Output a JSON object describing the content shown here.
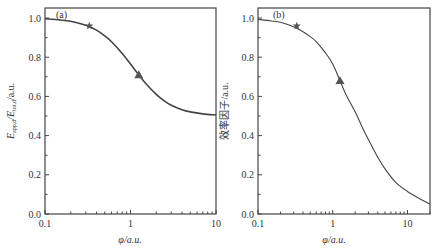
{
  "chart_data": [
    {
      "type": "line",
      "panel": "(a)",
      "title": "",
      "xlabel": "φ/a.u.",
      "ylabel": "E_app,d/E_tot,d/a.u.",
      "xscale": "log",
      "xlim": [
        0.1,
        10
      ],
      "ylim": [
        0.0,
        1.05
      ],
      "xticks": [
        "0.1",
        "1",
        "10"
      ],
      "yticks": [
        "0.0",
        "0.2",
        "0.4",
        "0.6",
        "0.8",
        "1.0"
      ],
      "grid": false,
      "series": [
        {
          "name": "curve",
          "x": [
            0.1,
            0.15,
            0.2,
            0.3,
            0.4,
            0.5,
            0.6,
            0.8,
            1.0,
            1.25,
            1.5,
            2.0,
            2.5,
            3.0,
            4.0,
            5.0,
            7.0,
            10.0
          ],
          "y": [
            0.996,
            0.99,
            0.983,
            0.963,
            0.938,
            0.909,
            0.879,
            0.819,
            0.765,
            0.71,
            0.667,
            0.61,
            0.576,
            0.555,
            0.532,
            0.521,
            0.511,
            0.505
          ]
        }
      ],
      "markers": [
        {
          "shape": "star",
          "x": 0.33,
          "y": 0.96
        },
        {
          "shape": "triangle",
          "x": 1.25,
          "y": 0.71
        }
      ]
    },
    {
      "type": "line",
      "panel": "(b)",
      "title": "",
      "xlabel": "φ/a.u.",
      "ylabel": "效率因子/a.u.",
      "xscale": "log",
      "xlim": [
        0.1,
        20
      ],
      "ylim": [
        0.0,
        1.05
      ],
      "xticks": [
        "0.1",
        "1",
        "10"
      ],
      "yticks": [
        "0.0",
        "0.2",
        "0.4",
        "0.6",
        "0.8",
        "1.0"
      ],
      "grid": false,
      "series": [
        {
          "name": "curve",
          "x": [
            0.1,
            0.15,
            0.2,
            0.3,
            0.4,
            0.5,
            0.6,
            0.8,
            1.0,
            1.25,
            1.5,
            2.0,
            2.5,
            3.0,
            4.0,
            5.0,
            7.0,
            10.0,
            15.0,
            20.0
          ],
          "y": [
            0.993,
            0.985,
            0.978,
            0.955,
            0.93,
            0.905,
            0.88,
            0.822,
            0.765,
            0.68,
            0.61,
            0.52,
            0.44,
            0.38,
            0.29,
            0.23,
            0.16,
            0.115,
            0.075,
            0.05
          ]
        }
      ],
      "markers": [
        {
          "shape": "star",
          "x": 0.33,
          "y": 0.96
        },
        {
          "shape": "triangle",
          "x": 1.25,
          "y": 0.68
        }
      ]
    }
  ],
  "panels": {
    "a": {
      "label": "(a)",
      "xlabel": "φ/a.u.",
      "ylabel_main": "E",
      "ylabel_sub1": "app,d",
      "ylabel_mid": "/E",
      "ylabel_sub2": "tot,d",
      "ylabel_tail": "/a.u."
    },
    "b": {
      "label": "(b)",
      "xlabel": "φ/a.u.",
      "ylabel": "效率因子/a.u."
    }
  },
  "colors": {
    "line": "#444444",
    "marker": "#555555",
    "frame": "#444444"
  }
}
